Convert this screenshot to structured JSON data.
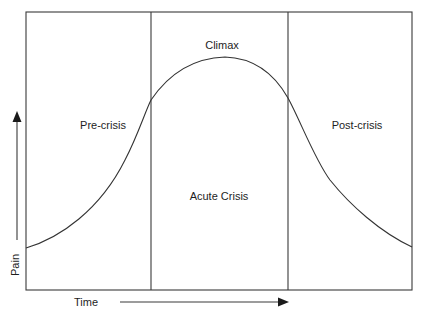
{
  "diagram": {
    "type": "crisis-phase-curve",
    "phases": [
      {
        "id": "pre-crisis",
        "label": "Pre-crisis"
      },
      {
        "id": "climax",
        "label": "Climax"
      },
      {
        "id": "acute-crisis",
        "label": "Acute Crisis"
      },
      {
        "id": "post-crisis",
        "label": "Post-crisis"
      }
    ],
    "y_axis": {
      "label": "Pain",
      "direction": "up"
    },
    "x_axis": {
      "label": "Time",
      "direction": "right"
    },
    "colors": {
      "line": "#333333",
      "background": "#ffffff",
      "text": "#1e1e1e"
    }
  }
}
